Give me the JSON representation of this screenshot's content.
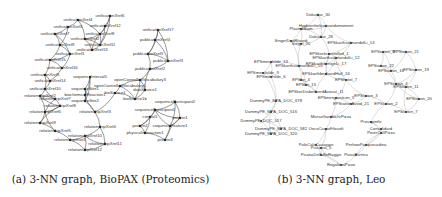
{
  "figure": {
    "panels": [
      {
        "id": "a",
        "caption": "(a) 3-NN graph, BioPAX (Proteomics)",
        "nodes": [
          {
            "label": "unificationXref6",
            "x": 110,
            "y": 16
          },
          {
            "label": "unificationXref4",
            "x": 78,
            "y": 20
          },
          {
            "label": "unificationXref3",
            "x": 68,
            "y": 27
          },
          {
            "label": "unificationXref12",
            "x": 105,
            "y": 26
          },
          {
            "label": "unificationXref17",
            "x": 158,
            "y": 30
          },
          {
            "label": "unificationXref7",
            "x": 55,
            "y": 34
          },
          {
            "label": "unificationXref8",
            "x": 100,
            "y": 34
          },
          {
            "label": "unificationXref2",
            "x": 85,
            "y": 39
          },
          {
            "label": "publicationXref4",
            "x": 155,
            "y": 40
          },
          {
            "label": "unificationXref9",
            "x": 60,
            "y": 45
          },
          {
            "label": "unificationXref11",
            "x": 100,
            "y": 45
          },
          {
            "label": "unificationXref13",
            "x": 92,
            "y": 50
          },
          {
            "label": "unificationXref1",
            "x": 70,
            "y": 54
          },
          {
            "label": "publicationXref5",
            "x": 148,
            "y": 54
          },
          {
            "label": "unificationXref15",
            "x": 50,
            "y": 60
          },
          {
            "label": "publicationXref3",
            "x": 168,
            "y": 61
          },
          {
            "label": "unificationXref16",
            "x": 62,
            "y": 68
          },
          {
            "label": "publicationXref2",
            "x": 150,
            "y": 69
          },
          {
            "label": "unificationXref5",
            "x": 45,
            "y": 75
          },
          {
            "label": "sequenceInterval1",
            "x": 90,
            "y": 77
          },
          {
            "label": "unificationXref14",
            "x": 50,
            "y": 81
          },
          {
            "label": "openControlledVocabulary3",
            "x": 140,
            "y": 80
          },
          {
            "label": "openControlledVocabulary1",
            "x": 120,
            "y": 86
          },
          {
            "label": "unificationXref10",
            "x": 45,
            "y": 89
          },
          {
            "label": "sequenceSite1",
            "x": 85,
            "y": 89
          },
          {
            "label": "dataSource1",
            "x": 145,
            "y": 90
          },
          {
            "label": "bioSource1",
            "x": 115,
            "y": 93
          },
          {
            "label": "relationshipXref2",
            "x": 40,
            "y": 96
          },
          {
            "label": "biochemicalReaction1",
            "x": 85,
            "y": 95
          },
          {
            "label": "bioSource1b",
            "x": 135,
            "y": 99
          },
          {
            "label": "relationshipXref7",
            "x": 55,
            "y": 99
          },
          {
            "label": "sequenceSite2",
            "x": 85,
            "y": 101
          },
          {
            "label": "relationshipXref8",
            "x": 60,
            "y": 106
          },
          {
            "label": "sequenceParticipant2",
            "x": 175,
            "y": 102
          },
          {
            "label": "relationshipXref6",
            "x": 45,
            "y": 112
          },
          {
            "label": "relationshipXref3",
            "x": 95,
            "y": 112
          },
          {
            "label": "sequenceParticipant1",
            "x": 155,
            "y": 110
          },
          {
            "label": "control1",
            "x": 150,
            "y": 117
          },
          {
            "label": "protein1",
            "x": 180,
            "y": 118
          },
          {
            "label": "relationshipXref9",
            "x": 40,
            "y": 123
          },
          {
            "label": "relationshipXref4",
            "x": 100,
            "y": 127
          },
          {
            "label": "protein2",
            "x": 140,
            "y": 126
          },
          {
            "label": "sequenceFeature1",
            "x": 170,
            "y": 126
          },
          {
            "label": "relationshipXref5",
            "x": 55,
            "y": 131
          },
          {
            "label": "relationshipXref10",
            "x": 85,
            "y": 136
          },
          {
            "label": "physicalInteraction1",
            "x": 145,
            "y": 133
          },
          {
            "label": "relationshipXref1",
            "x": 70,
            "y": 140
          },
          {
            "label": "relationshipXref11",
            "x": 105,
            "y": 144
          },
          {
            "label": "protein3",
            "x": 165,
            "y": 140
          },
          {
            "label": "relationshipXref12",
            "x": 85,
            "y": 150
          }
        ]
      },
      {
        "id": "b",
        "caption": "(b) 3-NN graph, Leo",
        "nodes": [
          {
            "label": "Dokudae_30",
            "x": 97,
            "y": 15
          },
          {
            "label": "Hypbrenhelicetnandomoment",
            "x": 105,
            "y": 26
          },
          {
            "label": "Plasmodium",
            "x": 80,
            "y": 29
          },
          {
            "label": "Dokudae_28",
            "x": 100,
            "y": 37
          },
          {
            "label": "SingerDaeRhaedi",
            "x": 70,
            "y": 41
          },
          {
            "label": "Siegel_20",
            "x": 80,
            "y": 44
          },
          {
            "label": "EPSkarthsalmandolLi_14",
            "x": 130,
            "y": 43
          },
          {
            "label": "EPSkerkcontrolled_1",
            "x": 108,
            "y": 54
          },
          {
            "label": "EPSkarthsalmandolLi_12",
            "x": 115,
            "y": 58
          },
          {
            "label": "EPStation_8",
            "x": 162,
            "y": 52
          },
          {
            "label": "EPStation_21",
            "x": 185,
            "y": 52
          },
          {
            "label": "EPSmerphilde_13",
            "x": 50,
            "y": 62
          },
          {
            "label": "EPSkarthsalmandolLi_10",
            "x": 78,
            "y": 66
          },
          {
            "label": "EPSkarthbenignLi_17",
            "x": 105,
            "y": 64
          },
          {
            "label": "EPStation_22",
            "x": 160,
            "y": 66
          },
          {
            "label": "EPStation_16",
            "x": 170,
            "y": 71
          },
          {
            "label": "EPStation_19",
            "x": 195,
            "y": 70
          },
          {
            "label": "EPSmernhilde_9",
            "x": 42,
            "y": 73
          },
          {
            "label": "EPSkarthbedoordHalf_16",
            "x": 105,
            "y": 74
          },
          {
            "label": "EPSmerhilde_6",
            "x": 50,
            "y": 77
          },
          {
            "label": "EPSbe_4",
            "x": 80,
            "y": 80
          },
          {
            "label": "EPShotel_7",
            "x": 125,
            "y": 80
          },
          {
            "label": "EPStation_4",
            "x": 175,
            "y": 84
          },
          {
            "label": "EPSbe_15",
            "x": 85,
            "y": 85
          },
          {
            "label": "EPStation_11",
            "x": 185,
            "y": 87
          },
          {
            "label": "EPSkerDisbedeerdAvocat_11",
            "x": 95,
            "y": 92
          },
          {
            "label": "EPSmergrontcon_5",
            "x": 115,
            "y": 98
          },
          {
            "label": "EPStation_3",
            "x": 145,
            "y": 96
          },
          {
            "label": "EPStation_20",
            "x": 198,
            "y": 99
          },
          {
            "label": "DummyPE_MPA_DOC_678",
            "x": 55,
            "y": 101
          },
          {
            "label": "EPStationAvoid_21",
            "x": 130,
            "y": 104
          },
          {
            "label": "EPStation_2",
            "x": 165,
            "y": 104
          },
          {
            "label": "DummyPE_MPA_DOC_516",
            "x": 50,
            "y": 112
          },
          {
            "label": "EPStation_7",
            "x": 185,
            "y": 112
          },
          {
            "label": "DummyPE_DOC_517",
            "x": 40,
            "y": 121
          },
          {
            "label": "MorsoGandochrPizza",
            "x": 110,
            "y": 117
          },
          {
            "label": "Provapintle",
            "x": 150,
            "y": 122
          },
          {
            "label": "DummyPE_MPA_DOC_582",
            "x": 60,
            "y": 129
          },
          {
            "label": "OncoCarpoFilosoft",
            "x": 105,
            "y": 129
          },
          {
            "label": "Consolidard",
            "x": 160,
            "y": 129
          },
          {
            "label": "DummyPE_MPA_DOC_320",
            "x": 50,
            "y": 134
          },
          {
            "label": "PeterCaltPizza",
            "x": 160,
            "y": 133
          },
          {
            "label": "PoloCalsCavaggio",
            "x": 95,
            "y": 145
          },
          {
            "label": "PerhowPasquesadina",
            "x": 145,
            "y": 145
          },
          {
            "label": "Pissaina_5",
            "x": 100,
            "y": 148
          },
          {
            "label": "PisanaDellaBeRaggie",
            "x": 100,
            "y": 155
          },
          {
            "label": "PizzaPortina",
            "x": 135,
            "y": 155
          },
          {
            "label": "RegalanaPizza",
            "x": 120,
            "y": 165
          }
        ]
      }
    ]
  }
}
